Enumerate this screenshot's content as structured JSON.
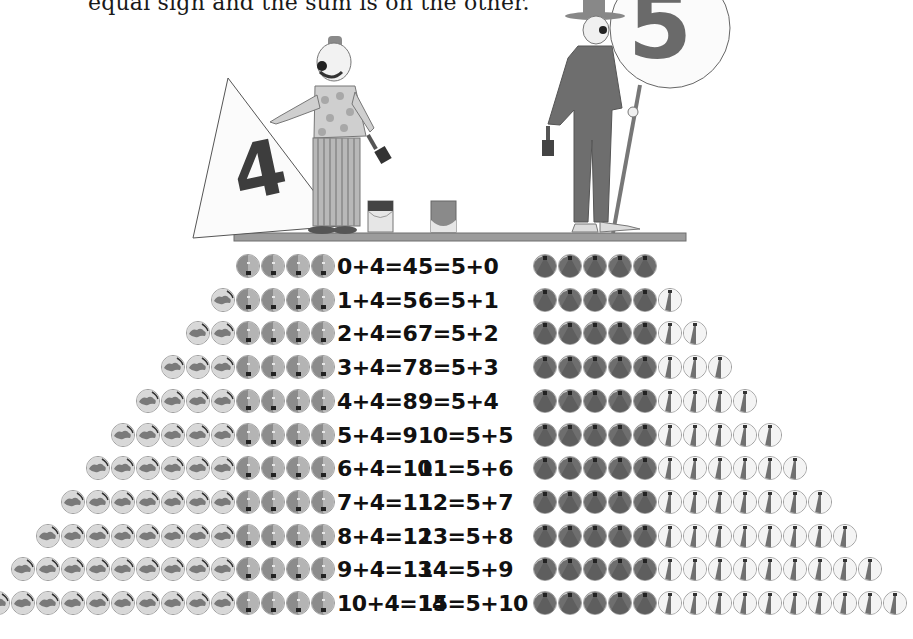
{
  "caption": "equal sign and the sum is on the other.",
  "illustration": {
    "left_sign_number": "4",
    "right_sign_number": "5",
    "left_figure": "clown holding triangle sign with paintbrush",
    "right_figure": "clown in hat holding round sign on pole with paintbrush",
    "props": [
      "paint-can",
      "paint-can",
      "shelf"
    ]
  },
  "legend": {
    "left_light_ball": "first addend ball (continent pattern)",
    "left_dark_ball": "addend 4 ball (split shade)",
    "right_dark_ball": "addend 5 ball (dark)",
    "right_striped_ball": "second addend ball (striped beach ball)"
  },
  "colors": {
    "ball_light_bg": "#d8d8d8",
    "ball_light_pattern": "#7a7a7a",
    "ball_split_dark": "#8c8c8c",
    "ball_split_light": "#b4b4b4",
    "ball_dark": "#6e6e6e",
    "ball_white": "#f4f4f4",
    "text": "#111111"
  },
  "rows": [
    {
      "left_eq": "0+4=4",
      "right_eq": "5=5+0",
      "left_light": 0,
      "left_dark": 4,
      "right_dark": 5,
      "right_striped": 0
    },
    {
      "left_eq": "1+4=5",
      "right_eq": "6=5+1",
      "left_light": 1,
      "left_dark": 4,
      "right_dark": 5,
      "right_striped": 1
    },
    {
      "left_eq": "2+4=6",
      "right_eq": "7=5+2",
      "left_light": 2,
      "left_dark": 4,
      "right_dark": 5,
      "right_striped": 2
    },
    {
      "left_eq": "3+4=7",
      "right_eq": "8=5+3",
      "left_light": 3,
      "left_dark": 4,
      "right_dark": 5,
      "right_striped": 3
    },
    {
      "left_eq": "4+4=8",
      "right_eq": "9=5+4",
      "left_light": 4,
      "left_dark": 4,
      "right_dark": 5,
      "right_striped": 4
    },
    {
      "left_eq": "5+4=9",
      "right_eq": "10=5+5",
      "left_light": 5,
      "left_dark": 4,
      "right_dark": 5,
      "right_striped": 5
    },
    {
      "left_eq": "6+4=10",
      "right_eq": "11=5+6",
      "left_light": 6,
      "left_dark": 4,
      "right_dark": 5,
      "right_striped": 6
    },
    {
      "left_eq": "7+4=11",
      "right_eq": "12=5+7",
      "left_light": 7,
      "left_dark": 4,
      "right_dark": 5,
      "right_striped": 7
    },
    {
      "left_eq": "8+4=12",
      "right_eq": "13=5+8",
      "left_light": 8,
      "left_dark": 4,
      "right_dark": 5,
      "right_striped": 8
    },
    {
      "left_eq": "9+4=13",
      "right_eq": "14=5+9",
      "left_light": 9,
      "left_dark": 4,
      "right_dark": 5,
      "right_striped": 9
    },
    {
      "left_eq": "10+4=14",
      "right_eq": "15=5+10",
      "left_light": 10,
      "left_dark": 4,
      "right_dark": 5,
      "right_striped": 10
    }
  ]
}
